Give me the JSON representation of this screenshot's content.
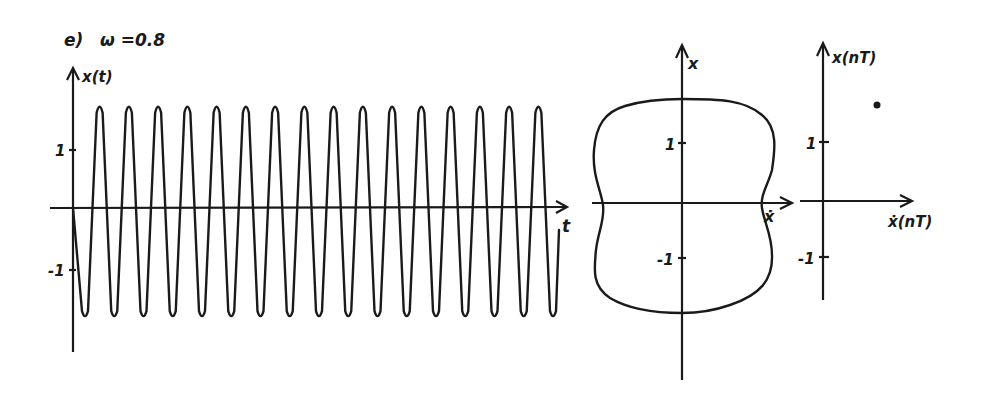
{
  "figure": {
    "panel_label": "e)",
    "parameter_label": "ω =0.8",
    "ink_color": "#1a1a1a",
    "background": "#ffffff"
  },
  "chart_data": [
    {
      "type": "line",
      "title": "e)  ω =0.8",
      "xlabel": "t",
      "ylabel": "x(t)",
      "yticks": [
        1,
        -1
      ],
      "ytick_labels": [
        "1",
        "-1"
      ],
      "grid": false,
      "amplitude_approx": 1.8,
      "peaks_count": 16,
      "troughs_count": 17,
      "peak_value_approx": 1.75,
      "trough_value_approx": -1.85,
      "description": "Periodic oscillation x(t) starting at 0, dropping to first trough, then ~16 full cycles of nearly constant amplitude"
    },
    {
      "type": "line",
      "title": "Phase portrait",
      "xlabel": "ẋ",
      "ylabel": "x",
      "yticks": [
        1,
        -1
      ],
      "ytick_labels": [
        "1",
        "-1"
      ],
      "grid": false,
      "description": "Single closed limit cycle, box-like shape with flattened top/bottom and slightly pinched sides",
      "closed_curve_extent": {
        "x_top": 1.85,
        "x_bottom": -1.85,
        "xdot_left": -1.4,
        "xdot_right": 1.4
      }
    },
    {
      "type": "scatter",
      "title": "Poincaré map",
      "xlabel": "ẋ(nT)",
      "ylabel": "x(nT)",
      "yticks": [
        1,
        -1
      ],
      "ytick_labels": [
        "1",
        "-1"
      ],
      "grid": false,
      "points": [
        {
          "xdot": 0.9,
          "x": 1.7
        }
      ],
      "description": "Single fixed point (period-1 motion)"
    }
  ],
  "labels": {
    "ts_y": "x(t)",
    "ts_x": "t",
    "ts_tick_pos": "1",
    "ts_tick_neg": "-1",
    "pp_y": "x",
    "pp_x": "ẋ",
    "pp_tick_pos": "1",
    "pp_tick_neg": "-1",
    "pm_y": "x(nT)",
    "pm_x": "ẋ(nT)",
    "pm_tick_pos": "1",
    "pm_tick_neg": "-1"
  }
}
